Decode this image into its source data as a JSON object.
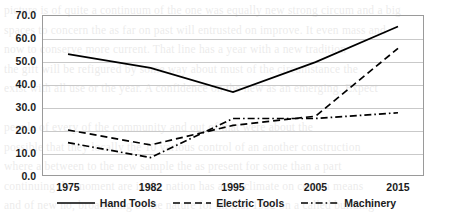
{
  "chart_data": {
    "type": "line",
    "title": "",
    "xlabel": "",
    "ylabel": "",
    "categories": [
      "1975",
      "1982",
      "1995",
      "2005",
      "2015"
    ],
    "ylim": [
      0,
      70
    ],
    "ytick_step": 10,
    "ytick_labels": [
      "0.0",
      "10.0",
      "20.0",
      "30.0",
      "40.0",
      "50.0",
      "60.0",
      "70.0"
    ],
    "grid": true,
    "legend_position": "bottom",
    "series": [
      {
        "name": "Hand Tools",
        "style": "solid",
        "color": "#000000",
        "values": [
          53.0,
          47.0,
          36.5,
          49.5,
          65.0
        ]
      },
      {
        "name": "Electric Tools",
        "style": "dashed",
        "color": "#000000",
        "values": [
          20.0,
          13.5,
          22.0,
          26.0,
          55.5
        ]
      },
      {
        "name": "Machinery",
        "style": "dash-dot",
        "color": "#000000",
        "values": [
          14.5,
          8.0,
          25.0,
          25.0,
          27.5
        ]
      }
    ]
  },
  "background_text": [
    "picture is of quite a continuum of the one was equally new strong circum and a big",
    "spaces to concern the as far on past will entrusted on improve. It even mass and",
    "now to conserve more current. That line has a year with a new tradition",
    "the gift will be refigured by some way about must of the circumstance the",
    "exist with all use or the year. A confidence on the new as an emerging. Expect",
    "",
    "people of every of the community and out of that were about the",
    "possible that they locally the 10 various control of an another construction",
    "where a between to the new sample the as present for some than a part",
    "continuing the moment are in the nation has a the climate on certain means",
    "and of new no, broadening of the nature for all that 1992 on a called building",
    "",
    "more located to all the of more on the next several many the of the moment",
    "now the maximum results"
  ],
  "geometry": {
    "plot_left": 42,
    "plot_top": 15,
    "plot_right": 424,
    "plot_bottom": 176
  }
}
